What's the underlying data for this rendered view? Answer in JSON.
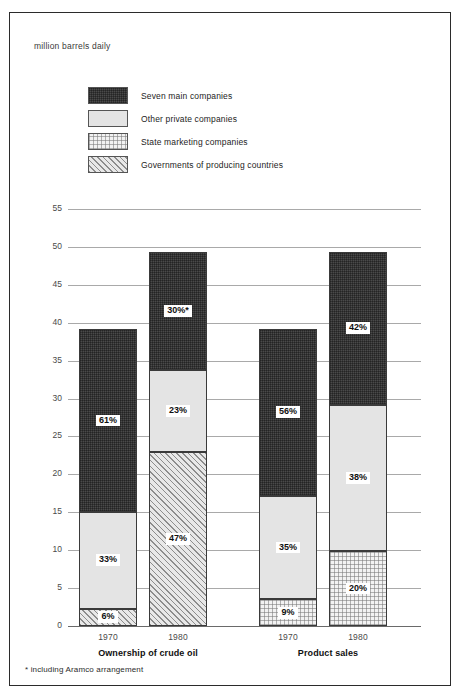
{
  "unit_label": "million barrels daily",
  "footnote": "* including Aramco arrangement",
  "legend": {
    "items": [
      {
        "label": "Seven main companies",
        "key": "seven",
        "swatch": "dark-crosshatch-swatch",
        "color": "#4a4a4a"
      },
      {
        "label": "Other private companies",
        "key": "other",
        "swatch": "light-gray-swatch",
        "color": "#e4e4e4"
      },
      {
        "label": "State marketing companies",
        "key": "state",
        "swatch": "dotted-swatch",
        "color": "#f2f2f2"
      },
      {
        "label": "Governments of producing countries",
        "key": "gov",
        "swatch": "diagonal-hatch-swatch",
        "color": "#e8e8e8"
      }
    ]
  },
  "chart_data": {
    "type": "bar",
    "subtype": "stacked",
    "title": "",
    "xlabel": "",
    "ylabel": "million barrels daily",
    "ylim": [
      0,
      55
    ],
    "yticks": [
      0,
      5,
      10,
      15,
      20,
      25,
      30,
      35,
      40,
      45,
      50,
      55
    ],
    "grid": true,
    "legend_position": "top-left",
    "groups": [
      "Ownership of crude oil",
      "Product sales"
    ],
    "categories": [
      "1970",
      "1980",
      "1970",
      "1980"
    ],
    "series": [
      {
        "name": "Seven main companies",
        "key": "seven",
        "values": [
          24.2,
          15.5,
          22.0,
          20.1
        ]
      },
      {
        "name": "Other private companies",
        "key": "other",
        "values": [
          12.7,
          10.8,
          13.7,
          19.3
        ]
      },
      {
        "name": "State marketing companies",
        "key": "state",
        "values": [
          0,
          0,
          3.5,
          9.9
        ]
      },
      {
        "name": "Governments of producing countries",
        "key": "gov",
        "values": [
          2.3,
          23.0,
          0,
          0
        ]
      }
    ],
    "bars": [
      {
        "group": "Ownership of crude oil",
        "category": "1970",
        "total": 39.2,
        "segments": [
          {
            "key": "seven",
            "name": "Seven main companies",
            "label": "61%",
            "percent": 61,
            "value": 24.2,
            "y0": 15.0,
            "y1": 39.2
          },
          {
            "key": "other",
            "name": "Other private companies",
            "label": "33%",
            "percent": 33,
            "value": 12.7,
            "y0": 2.3,
            "y1": 15.0
          },
          {
            "key": "gov",
            "name": "Governments of producing countries",
            "label": "6%",
            "percent": 6,
            "value": 2.3,
            "y0": 0,
            "y1": 2.3
          }
        ]
      },
      {
        "group": "Ownership of crude oil",
        "category": "1980",
        "total": 49.3,
        "segments": [
          {
            "key": "seven",
            "name": "Seven main companies",
            "label": "30%*",
            "percent": 30,
            "value": 15.5,
            "y0": 33.8,
            "y1": 49.3
          },
          {
            "key": "other",
            "name": "Other private companies",
            "label": "23%",
            "percent": 23,
            "value": 10.8,
            "y0": 23.0,
            "y1": 33.8
          },
          {
            "key": "gov",
            "name": "Governments of producing countries",
            "label": "47%",
            "percent": 47,
            "value": 23.0,
            "y0": 0,
            "y1": 23.0
          }
        ]
      },
      {
        "group": "Product sales",
        "category": "1970",
        "total": 39.2,
        "segments": [
          {
            "key": "seven",
            "name": "Seven main companies",
            "label": "56%",
            "percent": 56,
            "value": 22.0,
            "y0": 17.2,
            "y1": 39.2
          },
          {
            "key": "other",
            "name": "Other private companies",
            "label": "35%",
            "percent": 35,
            "value": 13.7,
            "y0": 3.5,
            "y1": 17.2
          },
          {
            "key": "state",
            "name": "State marketing companies",
            "label": "9%",
            "percent": 9,
            "value": 3.5,
            "y0": 0,
            "y1": 3.5
          }
        ]
      },
      {
        "group": "Product sales",
        "category": "1980",
        "total": 49.3,
        "segments": [
          {
            "key": "seven",
            "name": "Seven main companies",
            "label": "42%",
            "percent": 42,
            "value": 20.1,
            "y0": 29.2,
            "y1": 49.3
          },
          {
            "key": "other",
            "name": "Other private companies",
            "label": "38%",
            "percent": 38,
            "value": 19.3,
            "y0": 9.9,
            "y1": 29.2
          },
          {
            "key": "state",
            "name": "State marketing companies",
            "label": "20%",
            "percent": 20,
            "value": 9.9,
            "y0": 0,
            "y1": 9.9
          }
        ]
      }
    ]
  }
}
